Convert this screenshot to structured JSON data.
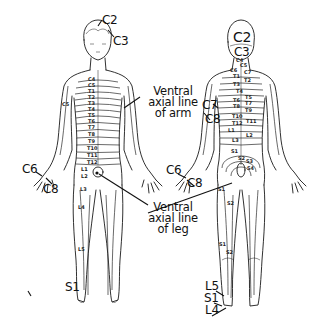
{
  "diagram": {
    "type": "dermatome-map",
    "views": [
      "anterior",
      "posterior"
    ]
  },
  "anterior": {
    "head_labels": {
      "c2": "C2",
      "c3": "C3"
    },
    "trunk_segments": [
      "C4",
      "C5",
      "T1",
      "T2",
      "T3",
      "T4",
      "T5",
      "T6",
      "T7",
      "T8",
      "T9",
      "T10",
      "T11",
      "T12",
      "L1"
    ],
    "arm_labels": {
      "c5": "C5",
      "c6": "C6",
      "c8": "C8"
    },
    "leg_labels": {
      "l2": "L2",
      "l3": "L3",
      "l4": "L4",
      "l5": "L5",
      "s1": "S1"
    },
    "annotation_arm": {
      "line1": "Ventral",
      "line2": "axial line",
      "line3": "of arm"
    },
    "annotation_leg": {
      "line1": "Ventral",
      "line2": "axial line",
      "line3": "of leg"
    }
  },
  "posterior": {
    "head_labels": {
      "c2": "C2",
      "c3": "C3"
    },
    "neck_segments": [
      "C4",
      "C5",
      "C6",
      "C7"
    ],
    "trunk_segments": [
      "T1",
      "T2",
      "T3",
      "T4",
      "T5",
      "T6",
      "T7",
      "T8",
      "T9",
      "T10",
      "T11",
      "T12",
      "L1",
      "L2",
      "L3"
    ],
    "sacral_segments": [
      "S1",
      "S2",
      "S3",
      "S4"
    ],
    "arm_labels": {
      "c6": "C6",
      "c7": "C7",
      "c8": "C8"
    },
    "leg_labels": {
      "s1": "S1",
      "s2": "S2",
      "s2b": "S2",
      "l5": "L5",
      "s1_foot": "S1",
      "l4": "L4"
    }
  }
}
